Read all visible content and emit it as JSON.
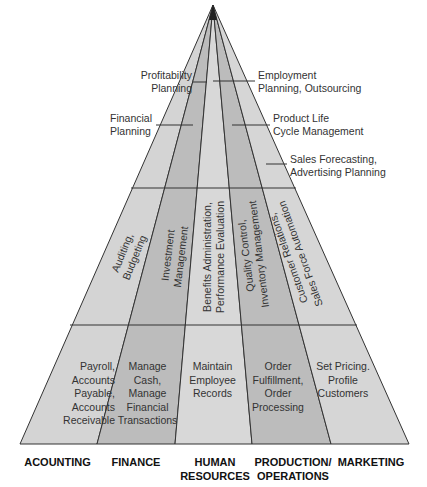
{
  "diagram": {
    "type": "pyramid",
    "colors": {
      "light": "#d6d6d6",
      "dark": "#bdbdbd",
      "line": "#333333"
    },
    "top_level": {
      "left": [
        {
          "text": "Profitability\nPlanning"
        },
        {
          "text": "Financial\nPlanning"
        }
      ],
      "right": [
        {
          "text": "Employment\nPlanning, Outsourcing"
        },
        {
          "text": "Product Life\nCycle Management"
        },
        {
          "text": "Sales Forecasting,\nAdvertising Planning"
        }
      ]
    },
    "middle_level": [
      {
        "text": "Auditing,\nBudgeting"
      },
      {
        "text": "Investment\nManagement"
      },
      {
        "text": "Benefits Administration,\nPerformance Evaluation"
      },
      {
        "text": "Quality Control,\nInventory Management"
      },
      {
        "text": "Customer Relations,\nSales Force Automation"
      }
    ],
    "bottom_level": [
      {
        "text": "Payroll,\nAccounts\nPayable,\nAccounts\nReceivable"
      },
      {
        "text": "Manage\nCash,\nManage\nFinancial\nTransactions"
      },
      {
        "text": "Maintain\nEmployee\nRecords"
      },
      {
        "text": "Order\nFulfillment,\nOrder\nProcessing"
      },
      {
        "text": "Set Pricing.\nProfile\nCustomers"
      }
    ],
    "departments": [
      {
        "label": "ACOUNTING"
      },
      {
        "label": "FINANCE"
      },
      {
        "label": "HUMAN\nRESOURCES"
      },
      {
        "label": "PRODUCTION/\nOPERATIONS"
      },
      {
        "label": "MARKETING"
      }
    ]
  }
}
